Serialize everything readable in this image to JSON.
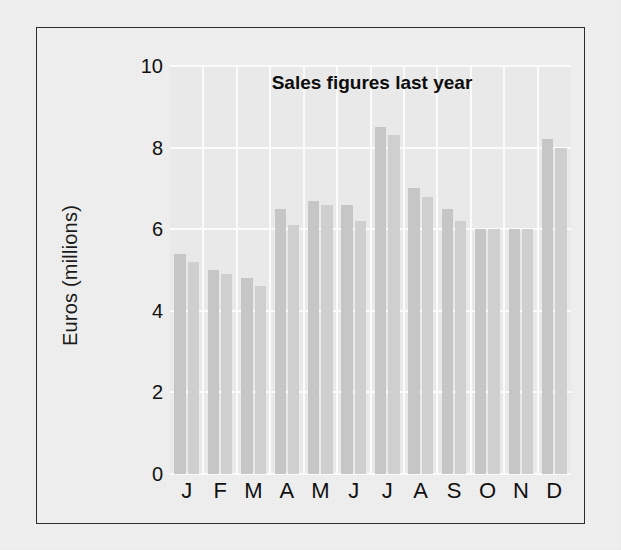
{
  "figure": {
    "border_color": "#2b2b2b",
    "page_background": "#f0f0f0",
    "plot_background": "#e9e9e9",
    "gridline_color": "#fbfbfb",
    "bar_color_primary": "#c6c6c6",
    "bar_color_secondary": "#cfcfcf"
  },
  "chart_data": {
    "type": "bar",
    "title": "Sales figures last year",
    "xlabel": "",
    "ylabel": "Euros (millions)",
    "categories": [
      "J",
      "F",
      "M",
      "A",
      "M",
      "J",
      "J",
      "A",
      "S",
      "O",
      "N",
      "D"
    ],
    "category_names": [
      "January",
      "February",
      "March",
      "April",
      "May",
      "June",
      "July",
      "August",
      "September",
      "October",
      "November",
      "December"
    ],
    "series": [
      {
        "name": "Series 1",
        "values": [
          5.4,
          5.0,
          4.8,
          6.5,
          6.7,
          6.6,
          8.5,
          7.0,
          6.5,
          6.0,
          6.0,
          8.2
        ]
      },
      {
        "name": "Series 2",
        "values": [
          5.2,
          4.9,
          4.6,
          6.1,
          6.6,
          6.2,
          8.3,
          6.8,
          6.2,
          6.0,
          6.0,
          8.0
        ]
      }
    ],
    "ylim": [
      0,
      10
    ],
    "yticks": [
      0,
      2,
      4,
      6,
      8,
      10
    ],
    "ytick_labels": [
      "0",
      "2",
      "4",
      "6",
      "8",
      "10"
    ],
    "grid": true,
    "grid_axis": "both",
    "legend": false,
    "legend_position": "none"
  }
}
